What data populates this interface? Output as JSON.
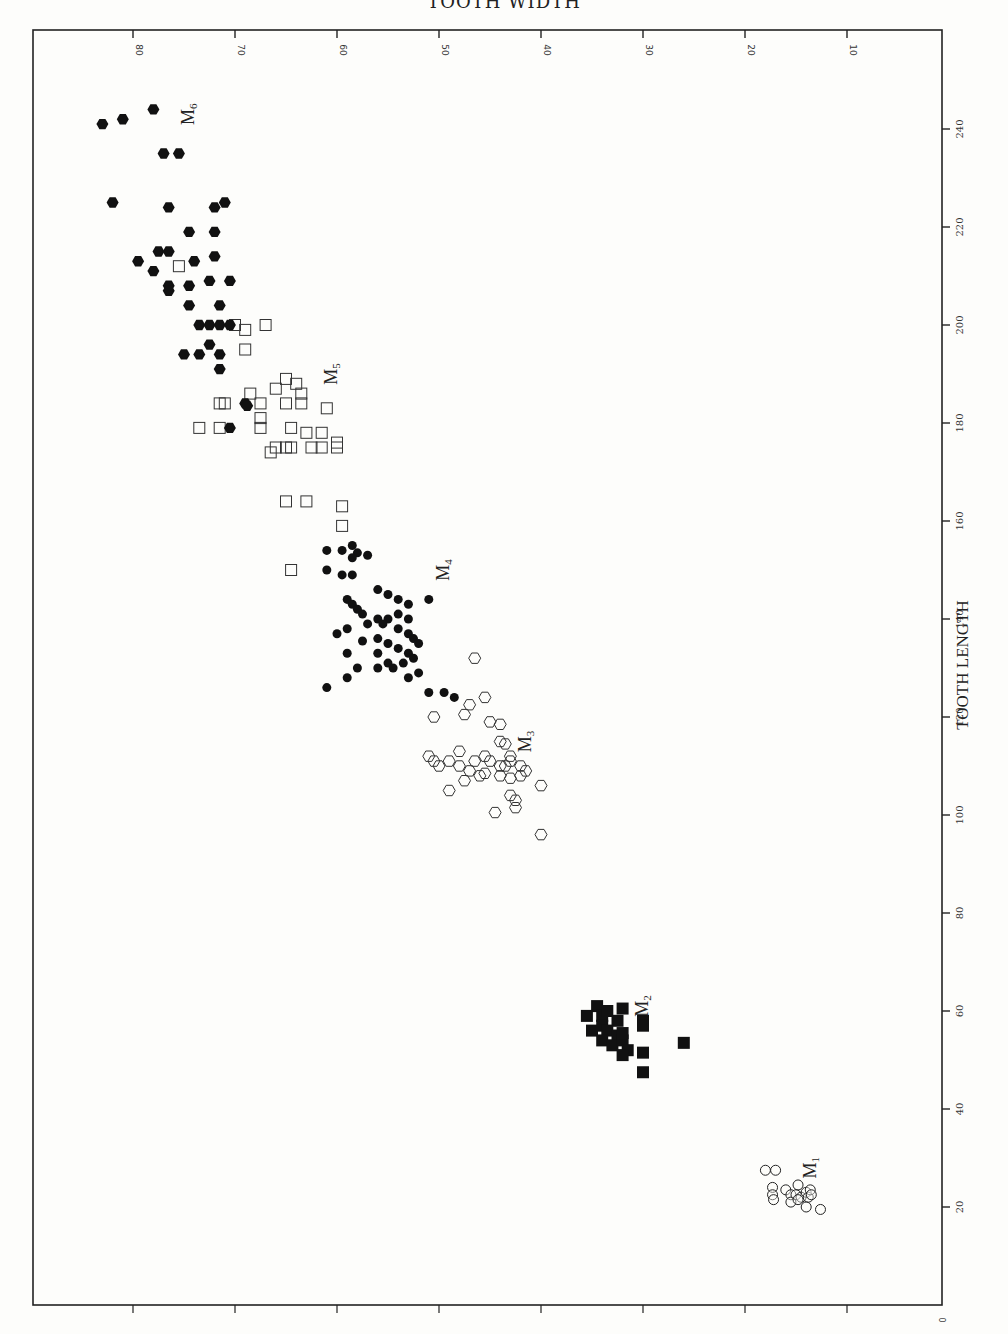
{
  "chart_data": {
    "type": "scatter",
    "orientation": "rotated-90deg (length runs vertically on right axis, width runs horizontally on top axis, reversed)",
    "digitization_note": "Approximate values hand-digitized from zoomed crops of a scanned, rotated plot. Not exact source data. Dense overlapping clusters (notably M1 and M2) are best-effort reconstructions; individual point positions and counts may not match the original.",
    "title": "TOOTH WIDTH",
    "xlabel": "TOOTH LENGTH",
    "ylabel": "TOOTH WIDTH",
    "x_axis": {
      "label": "TOOTH LENGTH",
      "ticks": [
        0,
        20,
        40,
        60,
        80,
        100,
        120,
        140,
        160,
        180,
        200,
        220,
        240
      ],
      "range": [
        0,
        250
      ]
    },
    "y_axis": {
      "label": "TOOTH WIDTH",
      "ticks": [
        10,
        20,
        30,
        40,
        50,
        60,
        70,
        80
      ],
      "range": [
        0,
        90
      ]
    },
    "grid": false,
    "legend": "inline labels M1–M6 next to clusters",
    "series": [
      {
        "name": "M1",
        "label": "M",
        "sub": "1",
        "marker": "circle-open",
        "label_pos": {
          "length": 28,
          "width": 13
        },
        "points": [
          [
            27.5,
            18
          ],
          [
            27.5,
            17
          ],
          [
            24,
            17.3
          ],
          [
            22.5,
            17.3
          ],
          [
            21.5,
            17.2
          ],
          [
            23.5,
            16
          ],
          [
            22.5,
            15.5
          ],
          [
            21,
            15.5
          ],
          [
            22.5,
            15
          ],
          [
            24.5,
            14.8
          ],
          [
            22,
            14.5
          ],
          [
            21.5,
            14.8
          ],
          [
            23,
            14
          ],
          [
            22,
            13.8
          ],
          [
            20,
            14
          ],
          [
            23.5,
            13.6
          ],
          [
            22.5,
            13.5
          ],
          [
            19.5,
            12.6
          ]
        ]
      },
      {
        "name": "M2",
        "label": "M",
        "sub": "2",
        "marker": "square-filled",
        "label_pos": {
          "length": 61,
          "width": 29.5
        },
        "points": [
          [
            61,
            34.5
          ],
          [
            59,
            35.5
          ],
          [
            59,
            34
          ],
          [
            58,
            32.5
          ],
          [
            60,
            33.5
          ],
          [
            57,
            34
          ],
          [
            56,
            35
          ],
          [
            56,
            33.5
          ],
          [
            55,
            32.5
          ],
          [
            54,
            34
          ],
          [
            53,
            33
          ],
          [
            54,
            32
          ],
          [
            52,
            31.5
          ],
          [
            51,
            32
          ],
          [
            60.5,
            32
          ],
          [
            58,
            30
          ],
          [
            57,
            30
          ],
          [
            53.5,
            26
          ],
          [
            51.5,
            30
          ],
          [
            47.5,
            30
          ],
          [
            55.5,
            32
          ]
        ]
      },
      {
        "name": "M3",
        "label": "M",
        "sub": "3",
        "marker": "hexagon-open",
        "label_pos": {
          "length": 115,
          "width": 41
        },
        "points": [
          [
            132,
            46.5
          ],
          [
            124,
            45.5
          ],
          [
            122.5,
            47
          ],
          [
            120.5,
            47.5
          ],
          [
            119,
            45
          ],
          [
            118.5,
            44
          ],
          [
            120,
            50.5
          ],
          [
            115,
            44
          ],
          [
            114.5,
            43.5
          ],
          [
            112,
            51
          ],
          [
            111,
            50.5
          ],
          [
            110,
            50
          ],
          [
            111,
            49
          ],
          [
            110,
            48
          ],
          [
            109,
            47
          ],
          [
            111,
            46.5
          ],
          [
            112,
            45.5
          ],
          [
            111,
            45
          ],
          [
            110,
            44
          ],
          [
            108.5,
            45.5
          ],
          [
            108,
            44
          ],
          [
            107.5,
            43
          ],
          [
            110,
            43.5
          ],
          [
            111,
            43
          ],
          [
            110,
            42
          ],
          [
            108,
            42
          ],
          [
            107,
            47.5
          ],
          [
            105,
            49
          ],
          [
            104,
            43
          ],
          [
            103,
            42.5
          ],
          [
            101.5,
            42.5
          ],
          [
            100.5,
            44.5
          ],
          [
            106,
            40
          ],
          [
            96,
            40
          ],
          [
            109,
            41.5
          ],
          [
            113,
            48
          ],
          [
            108,
            46
          ],
          [
            112,
            43
          ]
        ]
      },
      {
        "name": "M4",
        "label": "M",
        "sub": "4",
        "marker": "circle-filled",
        "label_pos": {
          "length": 150,
          "width": 49
        },
        "points": [
          [
            154,
            61
          ],
          [
            154,
            59.5
          ],
          [
            155,
            58.5
          ],
          [
            153.5,
            58
          ],
          [
            152.5,
            58.5
          ],
          [
            153,
            57
          ],
          [
            150,
            61
          ],
          [
            149,
            59.5
          ],
          [
            149,
            58.5
          ],
          [
            146,
            56
          ],
          [
            145,
            55
          ],
          [
            144,
            54
          ],
          [
            143,
            53
          ],
          [
            144,
            51
          ],
          [
            144,
            59
          ],
          [
            143,
            58.5
          ],
          [
            142,
            58
          ],
          [
            141,
            57.5
          ],
          [
            140,
            56
          ],
          [
            140,
            55
          ],
          [
            141,
            54
          ],
          [
            139,
            57
          ],
          [
            139,
            55.5
          ],
          [
            138,
            54
          ],
          [
            137,
            53
          ],
          [
            136,
            52.5
          ],
          [
            136,
            56
          ],
          [
            135.5,
            57.5
          ],
          [
            135,
            55
          ],
          [
            134,
            54
          ],
          [
            133,
            56
          ],
          [
            133,
            53
          ],
          [
            132,
            52.5
          ],
          [
            131,
            55
          ],
          [
            131,
            53.5
          ],
          [
            130,
            54.5
          ],
          [
            130,
            56
          ],
          [
            129,
            52
          ],
          [
            128,
            53
          ],
          [
            130,
            58
          ],
          [
            128,
            59
          ],
          [
            126,
            61
          ],
          [
            125,
            51
          ],
          [
            125,
            49.5
          ],
          [
            124,
            48.5
          ],
          [
            138,
            59
          ],
          [
            137,
            60
          ],
          [
            133,
            59
          ],
          [
            135,
            52
          ],
          [
            140,
            53
          ]
        ]
      },
      {
        "name": "M5",
        "label": "M",
        "sub": "5",
        "marker": "square-open",
        "label_pos": {
          "length": 190,
          "width": 60
        },
        "points": [
          [
            212,
            75.5
          ],
          [
            200,
            70
          ],
          [
            200,
            67
          ],
          [
            199,
            69
          ],
          [
            195,
            69
          ],
          [
            189,
            65
          ],
          [
            188,
            64
          ],
          [
            187,
            66
          ],
          [
            186,
            68.5
          ],
          [
            186,
            63.5
          ],
          [
            184,
            65
          ],
          [
            184,
            63.5
          ],
          [
            184,
            71.5
          ],
          [
            184,
            71
          ],
          [
            184,
            67.5
          ],
          [
            183,
            61
          ],
          [
            181,
            67.5
          ],
          [
            179,
            73.5
          ],
          [
            179,
            71.5
          ],
          [
            179,
            67.5
          ],
          [
            179,
            64.5
          ],
          [
            178,
            63
          ],
          [
            178,
            61.5
          ],
          [
            176,
            60
          ],
          [
            175,
            66
          ],
          [
            175,
            64.5
          ],
          [
            175,
            62.5
          ],
          [
            175,
            61.5
          ],
          [
            174,
            66.5
          ],
          [
            175,
            60
          ],
          [
            164,
            65
          ],
          [
            164,
            63
          ],
          [
            163,
            59.5
          ],
          [
            159,
            59.5
          ],
          [
            150,
            64.5
          ],
          [
            175,
            65
          ]
        ]
      },
      {
        "name": "M6",
        "label": "M",
        "sub": "6",
        "marker": "hexagon-filled",
        "label_pos": {
          "length": 243,
          "width": 74
        },
        "points": [
          [
            244,
            78
          ],
          [
            241,
            83
          ],
          [
            242,
            81
          ],
          [
            235,
            77
          ],
          [
            235,
            75.5
          ],
          [
            225,
            82
          ],
          [
            224,
            76.5
          ],
          [
            224,
            72
          ],
          [
            225,
            71
          ],
          [
            219,
            74.5
          ],
          [
            219,
            72
          ],
          [
            215,
            77.5
          ],
          [
            215,
            76.5
          ],
          [
            213,
            74
          ],
          [
            213,
            79.5
          ],
          [
            211,
            78
          ],
          [
            214,
            72
          ],
          [
            208,
            76.5
          ],
          [
            207,
            76.5
          ],
          [
            208,
            74.5
          ],
          [
            209,
            72.5
          ],
          [
            209,
            70.5
          ],
          [
            204,
            74.5
          ],
          [
            204,
            71.5
          ],
          [
            200,
            73.5
          ],
          [
            200,
            72.5
          ],
          [
            200,
            71.5
          ],
          [
            200,
            70.5
          ],
          [
            196,
            72.5
          ],
          [
            194,
            75
          ],
          [
            194,
            73.5
          ],
          [
            194,
            71.5
          ],
          [
            191,
            71.5
          ],
          [
            184,
            69
          ],
          [
            183.5,
            68.8
          ],
          [
            179,
            70.5
          ]
        ]
      }
    ]
  },
  "labels": {
    "top_title": "TOOTH WIDTH",
    "right_title": "TOOTH LENGTH",
    "origin": "0"
  }
}
